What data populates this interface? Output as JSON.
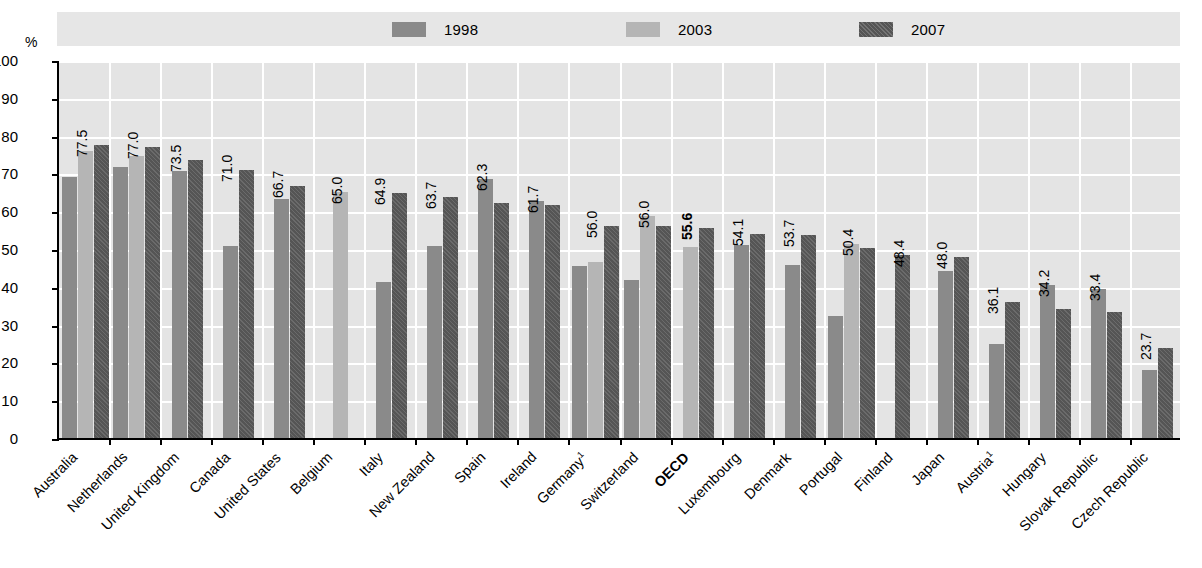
{
  "axis": {
    "unit_label": "%",
    "y_ticks": [
      "100",
      "90",
      "80",
      "70",
      "60",
      "50",
      "40",
      "30",
      "20",
      "10",
      "0"
    ]
  },
  "legend": {
    "items": [
      {
        "label": "1998",
        "color": "#8a8a8a",
        "key": "y1998"
      },
      {
        "label": "2003",
        "color": "#b5b5b5",
        "key": "y2003"
      },
      {
        "label": "2007",
        "color": "#555555",
        "key": "y2007"
      }
    ]
  },
  "chart_data": {
    "type": "bar",
    "title": "",
    "xlabel": "",
    "ylabel": "%",
    "ylim": [
      0,
      100
    ],
    "ytick_step": 10,
    "grid": true,
    "legend_position": "top",
    "categories": [
      "Australia",
      "Netherlands",
      "United Kingdom",
      "Canada",
      "United States",
      "Belgium",
      "Italy",
      "New Zealand",
      "Spain",
      "Ireland",
      "Germany",
      "Switzerland",
      "OECD",
      "Luxembourg",
      "Denmark",
      "Portugal",
      "Finland",
      "Japan",
      "Austria",
      "Hungary",
      "Slovak Republic",
      "Czech Republic"
    ],
    "category_footnotes": {
      "Germany": "1",
      "Austria": "1"
    },
    "highlighted_category": "OECD",
    "series": [
      {
        "name": "1998",
        "values": [
          69.0,
          71.8,
          70.6,
          50.7,
          63.2,
          null,
          41.2,
          50.9,
          68.4,
          62.6,
          45.5,
          41.8,
          null,
          51.0,
          45.8,
          32.4,
          null,
          44.1,
          25.0,
          40.6,
          39.4,
          17.9
        ]
      },
      {
        "name": "2003",
        "values": [
          76.0,
          74.5,
          null,
          null,
          null,
          65.0,
          null,
          null,
          null,
          null,
          46.5,
          58.8,
          50.5,
          null,
          null,
          51.2,
          null,
          null,
          null,
          null,
          null,
          null
        ]
      },
      {
        "name": "2007",
        "values": [
          77.5,
          77.0,
          73.5,
          71.0,
          66.7,
          null,
          64.9,
          63.7,
          62.3,
          61.7,
          56.0,
          56.0,
          55.6,
          54.1,
          53.7,
          50.4,
          48.4,
          48.0,
          36.1,
          34.2,
          33.4,
          23.7
        ]
      }
    ],
    "data_labels": [
      "77.5",
      "77.0",
      "73.5",
      "71.0",
      "66.7",
      "65.0",
      "64.9",
      "63.7",
      "62.3",
      "61.7",
      "56.0",
      "56.0",
      "55.6",
      "54.1",
      "53.7",
      "50.4",
      "48.4",
      "48.0",
      "36.1",
      "34.2",
      "33.4",
      "23.7"
    ],
    "bold_data_labels": [
      "55.6"
    ]
  }
}
